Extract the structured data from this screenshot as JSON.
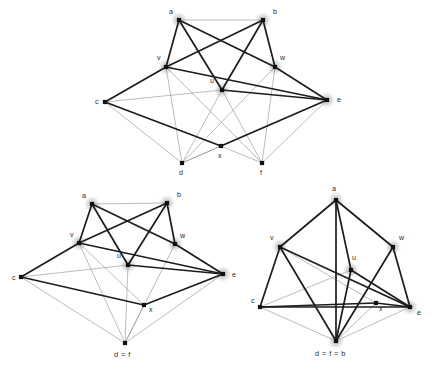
{
  "figure": {
    "title": "",
    "background_color": "#ffffff",
    "edge_colors": {
      "thick": "#1c1c1c",
      "thin": "#8f8f8f"
    },
    "node_colors": {
      "fill": "#111111",
      "halo": "#c9c9c9"
    },
    "label_color": "#2b2b2b"
  },
  "panels": [
    {
      "id": "panel-top",
      "name": "graph-top",
      "nodes": [
        {
          "id": "a",
          "label": "a",
          "x": 179,
          "y": 20,
          "lx": 169,
          "ly": 14,
          "halo": true
        },
        {
          "id": "b",
          "label": "b",
          "x": 263,
          "y": 20,
          "lx": 273,
          "ly": 14,
          "halo": true
        },
        {
          "id": "v",
          "label": "v",
          "x": 166,
          "y": 67,
          "lx": 157,
          "ly": 60,
          "halo": true
        },
        {
          "id": "w",
          "label": "w",
          "x": 275,
          "y": 67,
          "lx": 280,
          "ly": 60,
          "halo": true
        },
        {
          "id": "u",
          "label": "u",
          "x": 222,
          "y": 90,
          "lx": 210,
          "ly": 83,
          "halo": true
        },
        {
          "id": "c",
          "label": "c",
          "x": 105,
          "y": 102,
          "lx": 95,
          "ly": 104,
          "halo": false
        },
        {
          "id": "e",
          "label": "e",
          "x": 327,
          "y": 100,
          "lx": 337,
          "ly": 102,
          "halo": true
        },
        {
          "id": "x",
          "label": "x",
          "x": 221,
          "y": 146,
          "lx": 218,
          "ly": 158,
          "halo": false
        },
        {
          "id": "d",
          "label": "d",
          "x": 182,
          "y": 163,
          "lx": 179,
          "ly": 175,
          "halo": false
        },
        {
          "id": "f",
          "label": "f",
          "x": 262,
          "y": 163,
          "lx": 260,
          "ly": 175,
          "halo": false
        }
      ],
      "edges_thin": [
        [
          "a",
          "b"
        ],
        [
          "c",
          "u"
        ],
        [
          "c",
          "d"
        ],
        [
          "v",
          "d"
        ],
        [
          "v",
          "f"
        ],
        [
          "u",
          "d"
        ],
        [
          "u",
          "f"
        ],
        [
          "w",
          "d"
        ],
        [
          "w",
          "f"
        ],
        [
          "d",
          "x"
        ],
        [
          "x",
          "f"
        ],
        [
          "f",
          "e"
        ],
        [
          "d",
          "e"
        ]
      ],
      "edges_thick": [
        [
          "a",
          "v"
        ],
        [
          "a",
          "u"
        ],
        [
          "a",
          "w"
        ],
        [
          "b",
          "v"
        ],
        [
          "b",
          "u"
        ],
        [
          "b",
          "w"
        ],
        [
          "c",
          "v"
        ],
        [
          "c",
          "x"
        ],
        [
          "v",
          "e"
        ],
        [
          "u",
          "e"
        ],
        [
          "w",
          "e"
        ],
        [
          "x",
          "e"
        ]
      ]
    },
    {
      "id": "panel-bottom-left",
      "name": "graph-bottom-left",
      "nodes": [
        {
          "id": "a",
          "label": "a",
          "x": 92,
          "y": 204,
          "lx": 82,
          "ly": 198,
          "halo": true
        },
        {
          "id": "b",
          "label": "b",
          "x": 167,
          "y": 203,
          "lx": 177,
          "ly": 197,
          "halo": true
        },
        {
          "id": "v",
          "label": "v",
          "x": 79,
          "y": 243,
          "lx": 70,
          "ly": 237,
          "halo": true
        },
        {
          "id": "w",
          "label": "w",
          "x": 175,
          "y": 244,
          "lx": 180,
          "ly": 238,
          "halo": true
        },
        {
          "id": "u",
          "label": "u",
          "x": 128,
          "y": 265,
          "lx": 117,
          "ly": 258,
          "halo": true
        },
        {
          "id": "c",
          "label": "c",
          "x": 21,
          "y": 277,
          "lx": 12,
          "ly": 280,
          "halo": false
        },
        {
          "id": "e",
          "label": "e",
          "x": 223,
          "y": 274,
          "lx": 232,
          "ly": 277,
          "halo": true
        },
        {
          "id": "x",
          "label": "x",
          "x": 144,
          "y": 305,
          "lx": 149,
          "ly": 312,
          "halo": false
        },
        {
          "id": "df",
          "label": "d = f",
          "x": 125,
          "y": 343,
          "lx": 114,
          "ly": 357,
          "halo": false
        }
      ],
      "edges_thin": [
        [
          "a",
          "b"
        ],
        [
          "c",
          "u"
        ],
        [
          "c",
          "df"
        ],
        [
          "v",
          "df"
        ],
        [
          "u",
          "df"
        ],
        [
          "w",
          "df"
        ],
        [
          "x",
          "df"
        ],
        [
          "e",
          "df"
        ],
        [
          "v",
          "x"
        ]
      ],
      "edges_thick": [
        [
          "a",
          "v"
        ],
        [
          "a",
          "u"
        ],
        [
          "a",
          "w"
        ],
        [
          "b",
          "v"
        ],
        [
          "b",
          "u"
        ],
        [
          "b",
          "w"
        ],
        [
          "c",
          "v"
        ],
        [
          "c",
          "x"
        ],
        [
          "v",
          "e"
        ],
        [
          "u",
          "e"
        ],
        [
          "w",
          "e"
        ],
        [
          "x",
          "e"
        ]
      ]
    },
    {
      "id": "panel-bottom-right",
      "name": "graph-bottom-right",
      "nodes": [
        {
          "id": "a",
          "label": "a",
          "x": 336,
          "y": 200,
          "lx": 332,
          "ly": 191,
          "halo": true
        },
        {
          "id": "v",
          "label": "v",
          "x": 280,
          "y": 247,
          "lx": 270,
          "ly": 240,
          "halo": true
        },
        {
          "id": "w",
          "label": "w",
          "x": 393,
          "y": 247,
          "lx": 399,
          "ly": 240,
          "halo": true
        },
        {
          "id": "u",
          "label": "u",
          "x": 351,
          "y": 270,
          "lx": 352,
          "ly": 260,
          "halo": true
        },
        {
          "id": "c",
          "label": "c",
          "x": 260,
          "y": 307,
          "lx": 251,
          "ly": 303,
          "halo": false
        },
        {
          "id": "e",
          "label": "e",
          "x": 410,
          "y": 307,
          "lx": 417,
          "ly": 315,
          "halo": true
        },
        {
          "id": "x",
          "label": "x",
          "x": 376,
          "y": 303,
          "lx": 379,
          "ly": 311,
          "halo": false
        },
        {
          "id": "dfb",
          "label": "d = f = b",
          "x": 336,
          "y": 341,
          "lx": 315,
          "ly": 356,
          "halo": true
        }
      ],
      "edges_thin": [
        [
          "c",
          "u"
        ],
        [
          "c",
          "dfb"
        ],
        [
          "e",
          "dfb"
        ],
        [
          "x",
          "dfb"
        ],
        [
          "v",
          "x"
        ]
      ],
      "edges_thick": [
        [
          "a",
          "v"
        ],
        [
          "a",
          "u"
        ],
        [
          "a",
          "w"
        ],
        [
          "a",
          "dfb"
        ],
        [
          "v",
          "dfb"
        ],
        [
          "u",
          "dfb"
        ],
        [
          "w",
          "dfb"
        ],
        [
          "c",
          "v"
        ],
        [
          "c",
          "x"
        ],
        [
          "v",
          "e"
        ],
        [
          "u",
          "e"
        ],
        [
          "w",
          "e"
        ],
        [
          "x",
          "e"
        ],
        [
          "c",
          "e"
        ]
      ]
    }
  ]
}
